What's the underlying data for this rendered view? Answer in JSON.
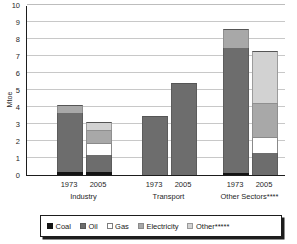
{
  "chart_data": {
    "type": "bar",
    "subtype": "stacked-bar",
    "title": "",
    "xlabel": "",
    "ylabel": "Mtoe",
    "ylim": [
      0,
      10
    ],
    "yticks": [
      0,
      1,
      2,
      3,
      4,
      5,
      6,
      7,
      8,
      9,
      10
    ],
    "ytick_labels": [
      "0",
      "1",
      "2",
      "3",
      "4",
      "5",
      "6",
      "7",
      "8",
      "9",
      "10"
    ],
    "grid": true,
    "legend_position": "bottom",
    "categories": [
      "1973",
      "2005",
      "1973",
      "2005",
      "1973",
      "2005"
    ],
    "groups": [
      {
        "label": "Industry",
        "years": [
          "1973",
          "2005"
        ]
      },
      {
        "label": "Transport",
        "years": [
          "1973",
          "2005"
        ]
      },
      {
        "label": "Other Sectors****",
        "years": [
          "1973",
          "2005"
        ]
      }
    ],
    "series": [
      {
        "name": "Coal",
        "color": "#141414",
        "values": [
          0.2,
          0.15,
          0.0,
          0.0,
          0.1,
          0.0
        ]
      },
      {
        "name": "Oil",
        "color": "#6d6d6d",
        "values": [
          3.45,
          1.05,
          3.5,
          5.4,
          7.35,
          1.3
        ]
      },
      {
        "name": "Gas",
        "color": "#ffffff",
        "values": [
          0.0,
          0.7,
          0.0,
          0.0,
          0.0,
          0.95
        ]
      },
      {
        "name": "Electricity",
        "color": "#a8a8a8",
        "values": [
          0.45,
          0.75,
          0.0,
          0.0,
          1.15,
          2.0
        ]
      },
      {
        "name": "Other*****",
        "color": "#d2d2d2",
        "values": [
          0.0,
          0.45,
          0.0,
          0.0,
          0.0,
          3.05
        ]
      }
    ],
    "totals": [
      4.1,
      3.1,
      3.5,
      5.4,
      8.6,
      7.3
    ]
  },
  "legend": {
    "items": [
      {
        "label": "Coal",
        "key": "coal"
      },
      {
        "label": "Oil",
        "key": "oil"
      },
      {
        "label": "Gas",
        "key": "gas"
      },
      {
        "label": "Electricity",
        "key": "electricity"
      },
      {
        "label": "Other*****",
        "key": "other"
      }
    ]
  }
}
